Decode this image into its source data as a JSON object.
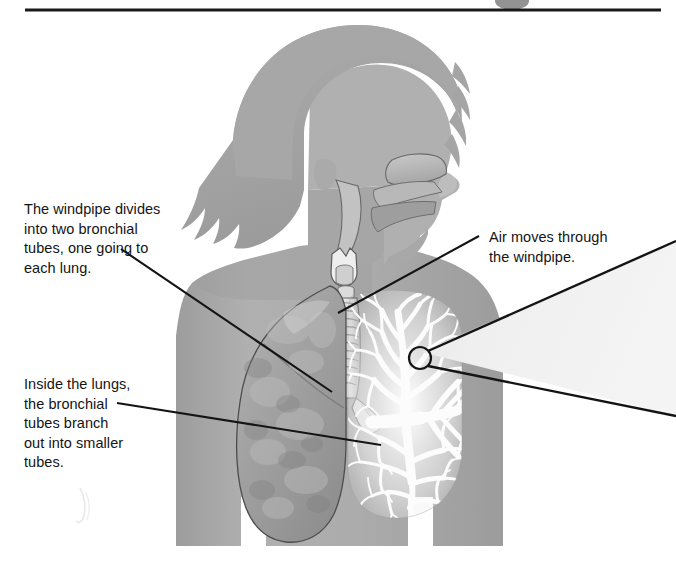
{
  "figure": {
    "width": 676,
    "height": 579,
    "background_color": "#ffffff"
  },
  "rule": {
    "name": "top-divider-rule",
    "color": "#1a1a1a",
    "x_start": 25,
    "x_end": 661,
    "y": 10,
    "thickness": 3
  },
  "page_marker": {
    "name": "cropped-page-number-bullet",
    "color": "#3a3a3a",
    "center_x": 512,
    "center_y": 1,
    "rx": 17,
    "ry": 9
  },
  "callouts": [
    {
      "id": "windpipe-divides",
      "text": "The windpipe divides\ninto two bronchial\ntubes, one going to\neach lung.",
      "x": 24,
      "y": 200,
      "leader": {
        "x1": 121,
        "y1": 249,
        "x2": 332,
        "y2": 392
      }
    },
    {
      "id": "inside-lungs",
      "text": "Inside the lungs,\nthe bronchial\ntubes branch\nout into smaller\ntubes.",
      "x": 24,
      "y": 375,
      "leader": {
        "x1": 117,
        "y1": 403,
        "x2": 381,
        "y2": 445
      }
    },
    {
      "id": "air-moves",
      "text": "Air moves through\nthe windpipe.",
      "x": 489,
      "y": 228,
      "leader": {
        "x1": 479,
        "y1": 236,
        "x2": 338,
        "y2": 313
      }
    }
  ],
  "magnifier": {
    "name": "bronchiole-magnifier-callout",
    "circle": {
      "cx": 420,
      "cy": 358,
      "r": 11
    },
    "wedge_fill": "#f1f1f1",
    "wedge_stroke": "#141414",
    "upper_line": {
      "x1": 428,
      "y1": 351,
      "x2": 676,
      "y2": 241
    },
    "lower_line": {
      "x1": 428,
      "y1": 366,
      "x2": 676,
      "y2": 416
    }
  },
  "anatomy": {
    "body_color": "#a9a9a9",
    "body_shadow_color": "#9a9a9a",
    "hair_color": "#a3a3a3",
    "solid_lung_color": "#9f9f9f",
    "bronchial_tree_color": "#fbfbfb",
    "trachea_color": "#d0d0d0",
    "outline_color": "#4a4a4a",
    "labels": {
      "head": "child-head-profile",
      "nasal_cavity": "nasal-cavity",
      "oral_cavity": "oral-cavity",
      "larynx": "larynx",
      "trachea": "trachea-windpipe",
      "left_lung": "solid-lung",
      "right_lung": "bronchial-tree-lung",
      "bronchi": "bronchial-tubes",
      "bronchioles": "smaller-tubes-bronchioles"
    }
  },
  "artifact": {
    "name": "faint-scan-artifact",
    "x": 72,
    "y": 486,
    "width": 22,
    "height": 36,
    "color": "#dedede"
  }
}
